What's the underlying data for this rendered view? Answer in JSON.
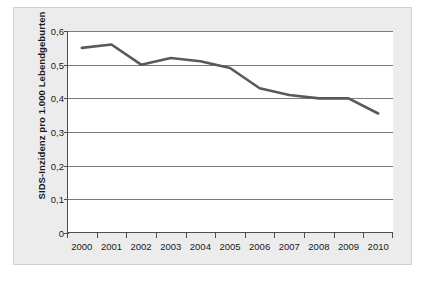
{
  "chart_data": {
    "type": "line",
    "title": "",
    "xlabel": "",
    "ylabel": "SIDS-Inzidenz pro 1.000 Lebendgeburten",
    "categories": [
      "2000",
      "2001",
      "2002",
      "2003",
      "2004",
      "2005",
      "2006",
      "2007",
      "2008",
      "2009",
      "2010"
    ],
    "x": [
      2000,
      2001,
      2002,
      2003,
      2004,
      2005,
      2006,
      2007,
      2008,
      2009,
      2010
    ],
    "values": [
      0.55,
      0.56,
      0.5,
      0.52,
      0.51,
      0.49,
      0.43,
      0.41,
      0.4,
      0.4,
      0.355
    ],
    "series": [
      {
        "name": "SIDS-Inzidenz",
        "values": [
          0.55,
          0.56,
          0.5,
          0.52,
          0.51,
          0.49,
          0.43,
          0.41,
          0.4,
          0.4,
          0.355
        ]
      }
    ],
    "ylim": [
      0,
      0.6
    ],
    "ytick_labels": [
      "0,6",
      "0,5",
      "0,4",
      "0,3",
      "0,2",
      "0,1",
      "0"
    ],
    "ytick_values": [
      0.6,
      0.5,
      0.4,
      0.3,
      0.2,
      0.1,
      0
    ],
    "xtick_labels": [
      "2000",
      "2001",
      "2002",
      "2003",
      "2004",
      "2005",
      "2006",
      "2007",
      "2008",
      "2009",
      "2010"
    ],
    "grid": true,
    "grid_axis": "y",
    "legend": false,
    "legend_position": "none",
    "line_color": "#595959",
    "grid_color": "#7a7a7a",
    "axis_color": "#4d4d4d",
    "plot_background": "#ffffff",
    "figure_background": "#ececec"
  }
}
